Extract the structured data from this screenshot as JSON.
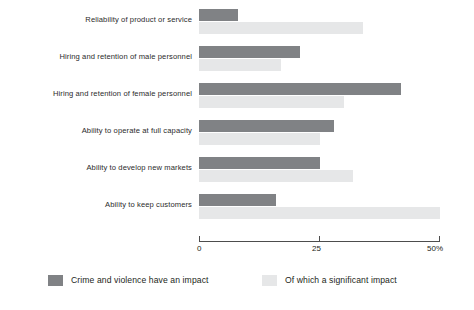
{
  "chart_data": {
    "type": "bar",
    "orientation": "horizontal",
    "grouped": true,
    "title": "",
    "subtitle": "",
    "xlabel": "",
    "ylabel": "",
    "xlim": [
      0,
      50
    ],
    "grid": false,
    "legend_position": "bottom",
    "axis": {
      "ticks": [
        0,
        25,
        50
      ],
      "tick_labels": [
        "0",
        "25",
        "50%"
      ],
      "unit": "%"
    },
    "categories": [
      "Reliability of product or service",
      "Hiring and retention of male personnel",
      "Hiring and retention of female personnel",
      "Ability to operate at full capacity",
      "Ability to develop new markets",
      "Ability to keep customers"
    ],
    "series": [
      {
        "name": "Crime and violence have an impact",
        "color": "#808285",
        "values": [
          8,
          21,
          42,
          28,
          25,
          16
        ]
      },
      {
        "name": "Of which a significant impact",
        "color": "#e6e7e8",
        "values": [
          34,
          17,
          30,
          25,
          32,
          50
        ]
      }
    ]
  },
  "legend": {
    "items": [
      {
        "label": "Crime and violence have an impact",
        "swatch": "primary"
      },
      {
        "label": "Of which a significant impact",
        "swatch": "secondary"
      }
    ]
  }
}
